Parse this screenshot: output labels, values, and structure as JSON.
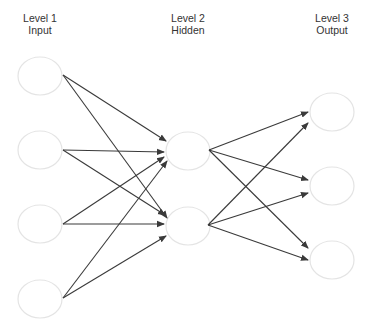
{
  "diagram": {
    "type": "feedforward-neural-network",
    "colors": {
      "edge": "#3a3a3a",
      "node_stroke": "#e4e4e4",
      "node_fill": "#ffffff",
      "text": "#333333"
    },
    "layers": [
      {
        "id": "L1",
        "title": "Level 1",
        "subtitle": "Input",
        "label_x": 40,
        "nodes": [
          {
            "id": "i1",
            "cx": 40,
            "cy": 76
          },
          {
            "id": "i2",
            "cx": 40,
            "cy": 150
          },
          {
            "id": "i3",
            "cx": 40,
            "cy": 224
          },
          {
            "id": "i4",
            "cx": 40,
            "cy": 299
          }
        ]
      },
      {
        "id": "L2",
        "title": "Level 2",
        "subtitle": "Hidden",
        "label_x": 188,
        "nodes": [
          {
            "id": "h1",
            "cx": 188,
            "cy": 151
          },
          {
            "id": "h2",
            "cx": 188,
            "cy": 226
          }
        ]
      },
      {
        "id": "L3",
        "title": "Level 3",
        "subtitle": "Output",
        "label_x": 332,
        "nodes": [
          {
            "id": "o1",
            "cx": 332,
            "cy": 112
          },
          {
            "id": "o2",
            "cx": 332,
            "cy": 186
          },
          {
            "id": "o3",
            "cx": 332,
            "cy": 260
          }
        ]
      }
    ],
    "edges": [
      {
        "from": "i1",
        "to": "h1",
        "x1": 63,
        "y1": 75,
        "x2": 166,
        "y2": 141
      },
      {
        "from": "i1",
        "to": "h2",
        "x1": 63,
        "y1": 75,
        "x2": 167,
        "y2": 218
      },
      {
        "from": "i2",
        "to": "h1",
        "x1": 63,
        "y1": 150,
        "x2": 164,
        "y2": 152
      },
      {
        "from": "i2",
        "to": "h2",
        "x1": 63,
        "y1": 150,
        "x2": 165,
        "y2": 215
      },
      {
        "from": "i3",
        "to": "h1",
        "x1": 63,
        "y1": 224,
        "x2": 164,
        "y2": 157
      },
      {
        "from": "i3",
        "to": "h2",
        "x1": 63,
        "y1": 224,
        "x2": 164,
        "y2": 224
      },
      {
        "from": "i4",
        "to": "h1",
        "x1": 63,
        "y1": 298,
        "x2": 167,
        "y2": 161
      },
      {
        "from": "i4",
        "to": "h2",
        "x1": 63,
        "y1": 298,
        "x2": 166,
        "y2": 236
      },
      {
        "from": "h1",
        "to": "o1",
        "x1": 209,
        "y1": 150,
        "x2": 308,
        "y2": 112
      },
      {
        "from": "h1",
        "to": "o2",
        "x1": 209,
        "y1": 150,
        "x2": 308,
        "y2": 180
      },
      {
        "from": "h1",
        "to": "o3",
        "x1": 209,
        "y1": 150,
        "x2": 308,
        "y2": 248
      },
      {
        "from": "h2",
        "to": "o1",
        "x1": 208,
        "y1": 225,
        "x2": 308,
        "y2": 123
      },
      {
        "from": "h2",
        "to": "o2",
        "x1": 208,
        "y1": 225,
        "x2": 308,
        "y2": 193
      },
      {
        "from": "h2",
        "to": "o3",
        "x1": 208,
        "y1": 225,
        "x2": 308,
        "y2": 260
      }
    ]
  }
}
